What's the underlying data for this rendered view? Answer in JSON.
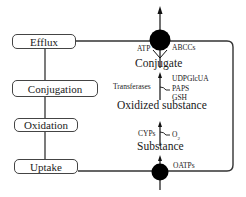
{
  "diagram": {
    "steps": [
      {
        "id": "efflux",
        "label": "Efflux"
      },
      {
        "id": "conjugation",
        "label": "Conjugation"
      },
      {
        "id": "oxidation",
        "label": "Oxidation"
      },
      {
        "id": "uptake",
        "label": "Uptake"
      }
    ],
    "cell": {
      "transporters": {
        "efflux": {
          "label": "ABCCs",
          "cofactor": "ATP"
        },
        "uptake": {
          "label": "OATPs"
        }
      },
      "pathway": {
        "substance": "Substance",
        "oxidized": "Oxidized substance",
        "conjugate": "Conjugate",
        "oxidation_enzyme": "CYPs",
        "oxidation_cofactor": "O",
        "oxidation_cofactor_sub": "2",
        "conjugation_enzyme": "Transferases",
        "conjugation_cofactors": [
          "UDPGlcUA",
          "PAPS",
          "GSH"
        ]
      }
    },
    "colors": {
      "line": "#333333",
      "transporter": "#000000",
      "box_border": "#444444"
    }
  }
}
